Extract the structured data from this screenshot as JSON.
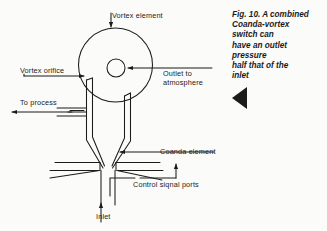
{
  "figure": {
    "title_caption": "Fig. 10. A combined\nCoanda-vortex\nswitch can\nhave an outlet\npressure\nhalf that of the\ninlet",
    "caption_marker": "left-pointing-triangle",
    "background_color": "#fbfbf9",
    "line_color": "#1b1b1b",
    "text_color": "#1b1b1b"
  },
  "labels": {
    "vortex_element": "Vortex element",
    "vortex_orifice": "Vortex orifice",
    "to_process": "To process",
    "outlet_to_atmosphere": "Outlet to\natmosphere",
    "coanda_element": "Coanda element",
    "control_signal_ports": "Control siqnal ports",
    "inlet": "Inlet"
  },
  "diagram": {
    "type": "technical-line-drawing",
    "components": [
      {
        "name": "vortex-chamber",
        "shape": "circle",
        "center_x": 115.5,
        "center_y": 65,
        "radius": 37
      },
      {
        "name": "outlet-orifice",
        "shape": "circle",
        "center_x": 116,
        "center_y": 68,
        "radius": 9
      },
      {
        "name": "nozzle-throat",
        "shape": "tapered-funnel",
        "top_left_x": 88,
        "top_right_x": 129,
        "apex_y": 168
      },
      {
        "name": "process-outlet-duct",
        "shape": "horizontal-duct",
        "y": 112,
        "direction": "left"
      },
      {
        "name": "control-port-left",
        "shape": "horizontal-duct",
        "y": 166,
        "direction": "left"
      },
      {
        "name": "control-port-right",
        "shape": "horizontal-duct",
        "y": 166,
        "direction": "right"
      },
      {
        "name": "inlet-channel",
        "shape": "vertical-duct",
        "x": 103,
        "direction": "up"
      }
    ],
    "flow_arrows": [
      {
        "name": "vortex-element-pointer",
        "direction": "down",
        "target": "vortex-chamber"
      },
      {
        "name": "vortex-orifice-pointer",
        "direction": "right",
        "target": "vortex-orifice"
      },
      {
        "name": "to-process-arrow",
        "direction": "left",
        "target": "process-outlet-duct"
      },
      {
        "name": "outlet-to-atmosphere-pointer",
        "direction": "left",
        "target": "outlet-orifice"
      },
      {
        "name": "coanda-element-pointer",
        "direction": "left",
        "target": "nozzle-throat"
      },
      {
        "name": "control-signal-ports-pointer",
        "direction": "up",
        "target": "control-port-right"
      },
      {
        "name": "control-signal-ports-pointer-2",
        "direction": "up",
        "target": "control-port-left"
      },
      {
        "name": "inlet-arrow",
        "direction": "up",
        "target": "inlet-channel"
      }
    ]
  }
}
